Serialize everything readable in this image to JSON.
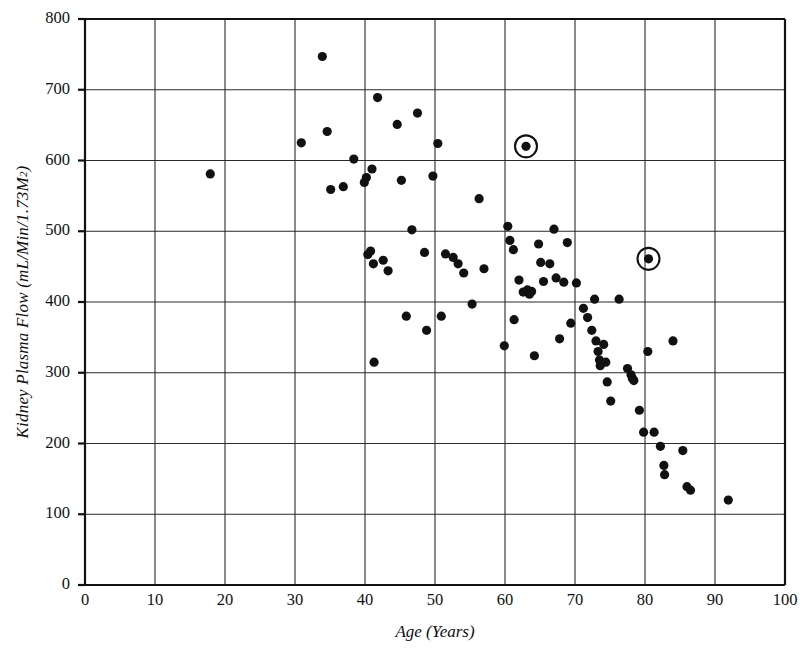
{
  "chart_data": {
    "type": "scatter",
    "title": "",
    "xlabel": "Age (Years)",
    "ylabel": "Kidney Plasma Flow (mL/Min/1.73M",
    "ylabel_sup": "2",
    "ylabel_tail": ")",
    "xlim": [
      0,
      100
    ],
    "ylim": [
      0,
      800
    ],
    "xticks": [
      0,
      10,
      20,
      30,
      40,
      50,
      60,
      70,
      80,
      90,
      100
    ],
    "yticks": [
      0,
      100,
      200,
      300,
      400,
      500,
      600,
      700,
      800
    ],
    "grid": true,
    "legend": "none",
    "marker_color": "#111111",
    "grid_color": "#2a2a2a",
    "background": "#ffffff",
    "points": [
      [
        17.9,
        581
      ],
      [
        30.9,
        625
      ],
      [
        33.9,
        747
      ],
      [
        34.6,
        641
      ],
      [
        35.1,
        559
      ],
      [
        36.9,
        563
      ],
      [
        38.4,
        602
      ],
      [
        39.9,
        569
      ],
      [
        40.2,
        576
      ],
      [
        40.4,
        467
      ],
      [
        40.8,
        472
      ],
      [
        41.0,
        588
      ],
      [
        41.2,
        454
      ],
      [
        41.3,
        315
      ],
      [
        41.8,
        689
      ],
      [
        42.6,
        459
      ],
      [
        43.3,
        444
      ],
      [
        44.6,
        651
      ],
      [
        45.2,
        572
      ],
      [
        45.9,
        380
      ],
      [
        46.7,
        502
      ],
      [
        47.5,
        667
      ],
      [
        48.5,
        470
      ],
      [
        48.8,
        360
      ],
      [
        49.7,
        578
      ],
      [
        50.4,
        624
      ],
      [
        50.9,
        380
      ],
      [
        51.5,
        468
      ],
      [
        52.6,
        463
      ],
      [
        53.3,
        454
      ],
      [
        54.1,
        441
      ],
      [
        55.3,
        397
      ],
      [
        56.3,
        546
      ],
      [
        57.0,
        447
      ],
      [
        59.9,
        338
      ],
      [
        60.4,
        507
      ],
      [
        60.7,
        487
      ],
      [
        61.2,
        474
      ],
      [
        61.3,
        375
      ],
      [
        62.0,
        431
      ],
      [
        62.6,
        414
      ],
      [
        63.0,
        620
      ],
      [
        63.2,
        417
      ],
      [
        63.5,
        411
      ],
      [
        63.8,
        415
      ],
      [
        64.2,
        324
      ],
      [
        64.8,
        482
      ],
      [
        65.1,
        456
      ],
      [
        65.5,
        429
      ],
      [
        66.4,
        454
      ],
      [
        67.0,
        503
      ],
      [
        67.3,
        434
      ],
      [
        67.8,
        348
      ],
      [
        68.4,
        428
      ],
      [
        68.9,
        484
      ],
      [
        69.4,
        370
      ],
      [
        70.2,
        427
      ],
      [
        71.2,
        391
      ],
      [
        71.8,
        378
      ],
      [
        72.4,
        360
      ],
      [
        72.8,
        404
      ],
      [
        73.0,
        345
      ],
      [
        73.3,
        330
      ],
      [
        73.5,
        318
      ],
      [
        73.6,
        310
      ],
      [
        74.1,
        340
      ],
      [
        74.4,
        315
      ],
      [
        74.6,
        287
      ],
      [
        75.1,
        260
      ],
      [
        76.3,
        404
      ],
      [
        77.5,
        306
      ],
      [
        78.0,
        297
      ],
      [
        78.2,
        292
      ],
      [
        78.4,
        289
      ],
      [
        79.2,
        247
      ],
      [
        79.8,
        216
      ],
      [
        80.4,
        330
      ],
      [
        80.5,
        461
      ],
      [
        81.3,
        216
      ],
      [
        82.2,
        196
      ],
      [
        82.7,
        169
      ],
      [
        82.8,
        156
      ],
      [
        84.0,
        345
      ],
      [
        85.4,
        190
      ],
      [
        86.0,
        139
      ],
      [
        86.5,
        134
      ],
      [
        91.9,
        120
      ]
    ],
    "highlighted_points": [
      {
        "x": 63.0,
        "y": 620,
        "marker": "circled"
      },
      {
        "x": 80.5,
        "y": 461,
        "marker": "circled"
      }
    ]
  }
}
